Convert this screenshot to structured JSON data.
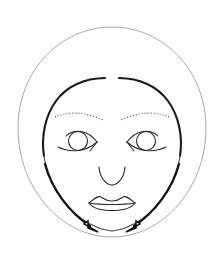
{
  "figure": {
    "background_color": "#ffffff",
    "width": 224,
    "height": 262,
    "caption": ""
  },
  "colors": {
    "head_outline": "#a8a8a8",
    "face_outline": "#1a1a1a",
    "feature_line": "#2a2a2a",
    "brow": "#3a3a3a",
    "arrow": "#111111",
    "arrow_head_fill": "#ffffff"
  },
  "parts": {
    "head_outline": {
      "label": "Head and hair outline",
      "shape": "circle",
      "cx": 112,
      "cy": 127,
      "r": 100,
      "stroke_width": 1,
      "tone": "light gray thin line"
    },
    "face_outline": {
      "label": "Face oval outline",
      "shape": "oval with gap at top center",
      "gap_at": "top center",
      "stroke_width": 2.1,
      "tone": "thick dark line"
    },
    "eyebrow_left": {
      "label": "Left eyebrow",
      "style": "dotted",
      "dash_pattern": "0.9 2.1"
    },
    "eyebrow_right": {
      "label": "Right eyebrow",
      "style": "dotted",
      "dash_pattern": "0.9 2.1"
    },
    "eye_left": {
      "label": "Left eye",
      "iris_cx": 78,
      "iris_cy": 141,
      "iris_r": 9.5
    },
    "eye_right": {
      "label": "Right eye",
      "iris_cx": 146,
      "iris_cy": 141,
      "iris_r": 9.5
    },
    "nose": {
      "label": "Nose",
      "shape": "u-curve"
    },
    "mouth": {
      "label": "Mouth with upper and lower lip",
      "shape": "cupid bow lips"
    },
    "arrow_left": {
      "label": "Left contour arrow",
      "direction": "downward toward chin",
      "start": "left temple",
      "end": "left of chin"
    },
    "arrow_right": {
      "label": "Right contour arrow",
      "direction": "downward toward chin",
      "start": "right temple",
      "end": "right of chin"
    }
  }
}
